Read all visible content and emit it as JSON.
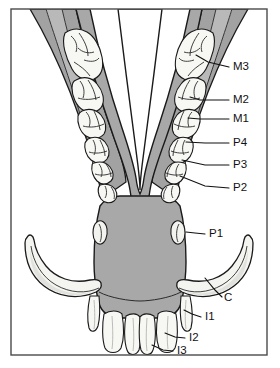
{
  "figure": {
    "kind": "anatomical-diagram",
    "title": "",
    "caption": "",
    "frame": {
      "border_color": "#4a4a4a",
      "background": "#ffffff"
    },
    "colors": {
      "bone_body": "#a8a8a8",
      "bone_ramus": "#9e9e9e",
      "bone_light": "#c9c9c9",
      "tooth_fill": "#f7f7f4",
      "tooth_shade": "#e3e3e0",
      "outline": "#1a1a1a",
      "label_text": "#111111",
      "leader_line": "#111111"
    }
  },
  "labels": [
    {
      "id": "M3",
      "text": "M3",
      "name": "third-molar",
      "x": 233,
      "y": 70,
      "leader": [
        [
          229,
          67
        ],
        [
          208,
          62
        ],
        [
          196,
          55
        ]
      ]
    },
    {
      "id": "M2",
      "text": "M2",
      "name": "second-molar",
      "x": 233,
      "y": 103,
      "leader": [
        [
          229,
          100
        ],
        [
          200,
          100
        ],
        [
          190,
          97
        ]
      ]
    },
    {
      "id": "M1",
      "text": "M1",
      "name": "first-molar",
      "x": 233,
      "y": 122,
      "leader": [
        [
          229,
          119
        ],
        [
          200,
          119
        ],
        [
          188,
          118
        ]
      ]
    },
    {
      "id": "P4",
      "text": "P4",
      "name": "fourth-premolar",
      "x": 233,
      "y": 146,
      "leader": [
        [
          229,
          143
        ],
        [
          205,
          143
        ],
        [
          186,
          142
        ]
      ]
    },
    {
      "id": "P3",
      "text": "P3",
      "name": "third-premolar",
      "x": 233,
      "y": 168,
      "leader": [
        [
          229,
          165
        ],
        [
          205,
          165
        ],
        [
          182,
          160
        ]
      ]
    },
    {
      "id": "P2",
      "text": "P2",
      "name": "second-premolar",
      "x": 233,
      "y": 191,
      "leader": [
        [
          229,
          188
        ],
        [
          205,
          186
        ],
        [
          180,
          176
        ]
      ]
    },
    {
      "id": "P1",
      "text": "P1",
      "name": "first-premolar",
      "x": 209,
      "y": 237,
      "leader": [
        [
          205,
          234
        ],
        [
          195,
          233
        ],
        [
          186,
          232
        ]
      ]
    },
    {
      "id": "C",
      "text": "C",
      "name": "canine",
      "x": 224,
      "y": 301,
      "leader": [
        [
          222,
          297
        ],
        [
          215,
          290
        ],
        [
          205,
          278
        ]
      ]
    },
    {
      "id": "I1",
      "text": "I1",
      "name": "first-incisor",
      "x": 205,
      "y": 320,
      "leader": [
        [
          201,
          317
        ],
        [
          192,
          314
        ],
        [
          184,
          310
        ]
      ]
    },
    {
      "id": "I2",
      "text": "I2",
      "name": "second-incisor",
      "x": 189,
      "y": 341,
      "leader": [
        [
          185,
          338
        ],
        [
          175,
          337
        ],
        [
          165,
          333
        ]
      ]
    },
    {
      "id": "I3",
      "text": "I3",
      "name": "third-incisor",
      "x": 177,
      "y": 354,
      "leader": [
        [
          173,
          351
        ],
        [
          163,
          350
        ],
        [
          152,
          345
        ]
      ]
    }
  ]
}
